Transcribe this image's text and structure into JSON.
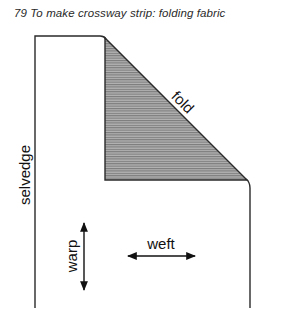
{
  "figure": {
    "caption": "79  To make crossway strip: folding fabric",
    "labels": {
      "selvedge": "selvedge",
      "fold": "fold",
      "warp": "warp",
      "weft": "weft"
    },
    "colors": {
      "line": "#2a2a2a",
      "shading": "#9a9a9a",
      "hatch": "#7a7a7a"
    }
  }
}
